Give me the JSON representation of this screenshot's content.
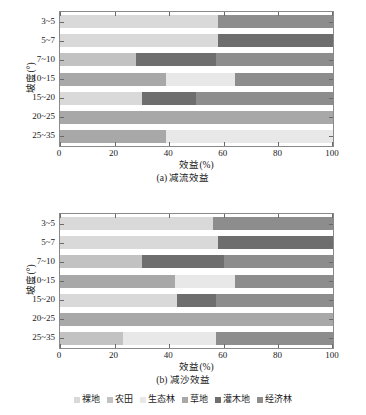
{
  "figure": {
    "legend": {
      "items": [
        {
          "label": "裸地",
          "color": "#d9d9d9"
        },
        {
          "label": "农田",
          "color": "#c2c2c2"
        },
        {
          "label": "生态林",
          "color": "#e8e8e8"
        },
        {
          "label": "草地",
          "color": "#a8a8a8"
        },
        {
          "label": "灌木地",
          "color": "#6e6e6e"
        },
        {
          "label": "经济林",
          "color": "#8d8d8d"
        }
      ]
    }
  },
  "chart_data": [
    {
      "id": "a",
      "type": "bar",
      "orientation": "horizontal",
      "stacked": true,
      "normalized": true,
      "title": "(a) 减流效益",
      "caption": "(a) 减流效益",
      "xlabel": "效益(%)",
      "ylabel": "坡度(°)",
      "xlim": [
        0,
        100
      ],
      "xticks": [
        0,
        20,
        40,
        60,
        80,
        100
      ],
      "xticklabels": [
        "0",
        "20",
        "40",
        "60",
        "80",
        "100"
      ],
      "grid": false,
      "legend_position": "bottom",
      "categories": [
        "3~5",
        "5~7",
        "7~10",
        "10~15",
        "15~20",
        "20~25",
        "25~35"
      ],
      "series": [
        {
          "name": "裸地",
          "color": "#d9d9d9",
          "values": [
            58,
            58,
            0,
            0,
            30,
            0,
            0
          ]
        },
        {
          "name": "农田",
          "color": "#c2c2c2",
          "values": [
            0,
            0,
            28,
            0,
            0,
            0,
            0
          ]
        },
        {
          "name": "生态林",
          "color": "#e8e8e8",
          "values": [
            0,
            0,
            0,
            0,
            0,
            0,
            61
          ]
        },
        {
          "name": "草地",
          "color": "#a8a8a8",
          "values": [
            0,
            0,
            0,
            39,
            0,
            100,
            39
          ]
        },
        {
          "name": "灌木地",
          "color": "#6e6e6e",
          "values": [
            0,
            42,
            29,
            0,
            20,
            0,
            0
          ]
        },
        {
          "name": "经济林",
          "color": "#8d8d8d",
          "values": [
            42,
            0,
            43,
            0,
            50,
            0,
            0
          ]
        },
        {
          "name": "生态林2",
          "color": "#e8e8e8",
          "values": [
            0,
            0,
            0,
            25,
            0,
            0,
            0
          ]
        },
        {
          "name": "经济林2",
          "color": "#8d8d8d",
          "values": [
            0,
            0,
            0,
            36,
            0,
            0,
            0
          ]
        }
      ],
      "bars": [
        {
          "category": "3~5",
          "segments": [
            {
              "name": "裸地",
              "value": 58,
              "color": "#d9d9d9"
            },
            {
              "name": "经济林",
              "value": 42,
              "color": "#8d8d8d"
            }
          ]
        },
        {
          "category": "5~7",
          "segments": [
            {
              "name": "裸地",
              "value": 58,
              "color": "#d9d9d9"
            },
            {
              "name": "灌木地",
              "value": 42,
              "color": "#6e6e6e"
            }
          ]
        },
        {
          "category": "7~10",
          "segments": [
            {
              "name": "农田",
              "value": 28,
              "color": "#c2c2c2"
            },
            {
              "name": "灌木地",
              "value": 29,
              "color": "#6e6e6e"
            },
            {
              "name": "经济林",
              "value": 43,
              "color": "#8d8d8d"
            }
          ]
        },
        {
          "category": "10~15",
          "segments": [
            {
              "name": "草地",
              "value": 39,
              "color": "#a8a8a8"
            },
            {
              "name": "生态林",
              "value": 25,
              "color": "#e8e8e8"
            },
            {
              "name": "经济林",
              "value": 36,
              "color": "#8d8d8d"
            }
          ]
        },
        {
          "category": "15~20",
          "segments": [
            {
              "name": "裸地",
              "value": 30,
              "color": "#d9d9d9"
            },
            {
              "name": "灌木地",
              "value": 20,
              "color": "#6e6e6e"
            },
            {
              "name": "经济林",
              "value": 50,
              "color": "#8d8d8d"
            }
          ]
        },
        {
          "category": "20~25",
          "segments": [
            {
              "name": "草地",
              "value": 100,
              "color": "#a8a8a8"
            }
          ]
        },
        {
          "category": "25~35",
          "segments": [
            {
              "name": "草地",
              "value": 39,
              "color": "#a8a8a8"
            },
            {
              "name": "生态林",
              "value": 61,
              "color": "#e8e8e8"
            }
          ]
        }
      ]
    },
    {
      "id": "b",
      "type": "bar",
      "orientation": "horizontal",
      "stacked": true,
      "normalized": true,
      "title": "(b) 减沙效益",
      "caption": "(b) 减沙效益",
      "xlabel": "效益(%)",
      "ylabel": "坡度(°)",
      "xlim": [
        0,
        100
      ],
      "xticks": [
        0,
        20,
        40,
        60,
        80,
        100
      ],
      "xticklabels": [
        "0",
        "20",
        "40",
        "60",
        "80",
        "100"
      ],
      "grid": false,
      "legend_position": "bottom",
      "categories": [
        "3~5",
        "5~7",
        "7~10",
        "10~15",
        "15~20",
        "20~25",
        "25~35"
      ],
      "series": [
        {
          "name": "裸地",
          "color": "#d9d9d9",
          "values": [
            56,
            58,
            0,
            0,
            43,
            0,
            0
          ]
        },
        {
          "name": "农田",
          "color": "#c2c2c2",
          "values": [
            0,
            0,
            30,
            0,
            0,
            0,
            23
          ]
        },
        {
          "name": "生态林",
          "color": "#e8e8e8",
          "values": [
            0,
            0,
            0,
            22,
            0,
            0,
            34
          ]
        },
        {
          "name": "草地",
          "color": "#a8a8a8",
          "values": [
            0,
            0,
            0,
            42,
            0,
            100,
            0
          ]
        },
        {
          "name": "灌木地",
          "color": "#6e6e6e",
          "values": [
            0,
            42,
            30,
            0,
            14,
            0,
            0
          ]
        },
        {
          "name": "经济林",
          "color": "#8d8d8d",
          "values": [
            44,
            0,
            40,
            36,
            43,
            0,
            43
          ]
        }
      ],
      "bars": [
        {
          "category": "3~5",
          "segments": [
            {
              "name": "裸地",
              "value": 56,
              "color": "#d9d9d9"
            },
            {
              "name": "经济林",
              "value": 44,
              "color": "#8d8d8d"
            }
          ]
        },
        {
          "category": "5~7",
          "segments": [
            {
              "name": "裸地",
              "value": 58,
              "color": "#d9d9d9"
            },
            {
              "name": "灌木地",
              "value": 42,
              "color": "#6e6e6e"
            }
          ]
        },
        {
          "category": "7~10",
          "segments": [
            {
              "name": "农田",
              "value": 30,
              "color": "#c2c2c2"
            },
            {
              "name": "灌木地",
              "value": 30,
              "color": "#6e6e6e"
            },
            {
              "name": "经济林",
              "value": 40,
              "color": "#8d8d8d"
            }
          ]
        },
        {
          "category": "10~15",
          "segments": [
            {
              "name": "草地",
              "value": 42,
              "color": "#a8a8a8"
            },
            {
              "name": "生态林",
              "value": 22,
              "color": "#e8e8e8"
            },
            {
              "name": "经济林",
              "value": 36,
              "color": "#8d8d8d"
            }
          ]
        },
        {
          "category": "15~20",
          "segments": [
            {
              "name": "裸地",
              "value": 43,
              "color": "#d9d9d9"
            },
            {
              "name": "灌木地",
              "value": 14,
              "color": "#6e6e6e"
            },
            {
              "name": "经济林",
              "value": 43,
              "color": "#8d8d8d"
            }
          ]
        },
        {
          "category": "20~25",
          "segments": [
            {
              "name": "草地",
              "value": 100,
              "color": "#a8a8a8"
            }
          ]
        },
        {
          "category": "25~35",
          "segments": [
            {
              "name": "农田",
              "value": 23,
              "color": "#c2c2c2"
            },
            {
              "name": "生态林",
              "value": 34,
              "color": "#e8e8e8"
            },
            {
              "name": "经济林",
              "value": 43,
              "color": "#8d8d8d"
            }
          ]
        }
      ]
    }
  ]
}
